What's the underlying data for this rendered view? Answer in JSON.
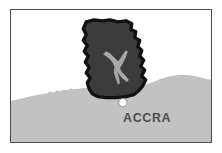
{
  "figure": {
    "type": "locator-map",
    "width": 222,
    "height": 153,
    "background_color": "#ffffff"
  },
  "frame": {
    "border_color": "#4a4a4a",
    "fill_color": "#ffffff"
  },
  "legend": {
    "country_label": "",
    "city_label": "ACCRA"
  },
  "map": {
    "region_name": "Ghana",
    "capital_marker": {
      "name": "Accra",
      "marker_shape": "filled-circle",
      "marker_color": "#ffffff",
      "marker_outline": "#7a7a7a"
    },
    "water_body": {
      "name": "Lake Volta",
      "color": "#a8a8a8"
    },
    "colors": {
      "ocean": "#ffffff",
      "surrounding_land": "#c2c2c2",
      "country_fill": "#3c3c3c",
      "country_outline": "#111111",
      "coast_tick": "#b0b0b0",
      "label_text": "#4d4d4d"
    }
  }
}
